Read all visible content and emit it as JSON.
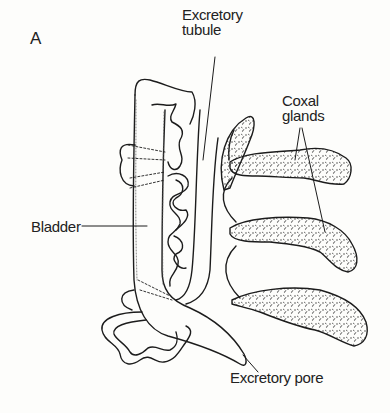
{
  "figure": {
    "panel_label": "A",
    "labels": {
      "excretory_tubule": [
        "Excretory",
        "tubule"
      ],
      "coxal_glands": [
        "Coxal",
        "glands"
      ],
      "bladder": "Bladder",
      "excretory_pore": "Excretory pore"
    },
    "colors": {
      "background": "#fdfdfb",
      "ink": "#1c1c1c",
      "stipple": "#2a2a2a"
    },
    "structures": [
      {
        "name": "bladder",
        "description": "elongated sac, vertical, stippled margin"
      },
      {
        "name": "excretory-tubule",
        "description": "coiled convoluted tubule between bladder and duct"
      },
      {
        "name": "coxal-glands",
        "count": 4,
        "description": "stippled lobes branching from main duct"
      },
      {
        "name": "excretory-duct",
        "description": "curved duct leading to excretory pore"
      }
    ]
  }
}
